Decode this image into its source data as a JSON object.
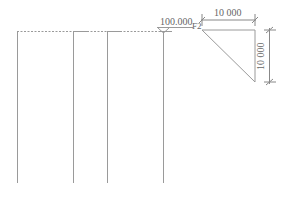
{
  "drawing": {
    "elevation_label": "100.000",
    "floor_label": "F2",
    "dim_horizontal": "10 000",
    "dim_vertical": "10 000"
  },
  "colors": {
    "line": "#9a9a9a",
    "text": "#666666",
    "background": "#ffffff"
  }
}
